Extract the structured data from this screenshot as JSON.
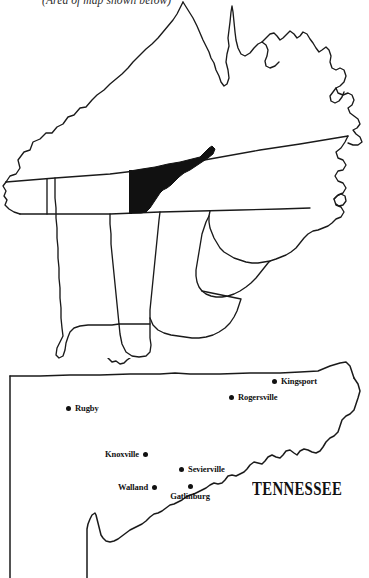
{
  "figure": {
    "caption": "(Area of map shown below)",
    "state_label": "TENNESSEE"
  },
  "locator_map": {
    "name": "southeastern-us-locator-map",
    "highlight_color": "#111111",
    "outline_color": "#1a1a1a",
    "highlighted_region": "East Tennessee",
    "states_shown": [
      "Kentucky",
      "West Virginia",
      "Virginia",
      "Tennessee",
      "North Carolina",
      "South Carolina",
      "Georgia",
      "Alabama",
      "Mississippi"
    ]
  },
  "detail_map": {
    "name": "east-tennessee-detail-map",
    "outline_color": "#1a1a1a",
    "cities": [
      {
        "name": "Kingsport",
        "label_position": "right",
        "x": 274,
        "y": 381
      },
      {
        "name": "Rogersville",
        "label_position": "right",
        "x": 231,
        "y": 397
      },
      {
        "name": "Rugby",
        "label_position": "right",
        "x": 69,
        "y": 408
      },
      {
        "name": "Knoxville",
        "label_position": "left",
        "x": 146,
        "y": 454
      },
      {
        "name": "Sevierville",
        "label_position": "right",
        "x": 182,
        "y": 468
      },
      {
        "name": "Walland",
        "label_position": "left",
        "x": 155,
        "y": 486
      },
      {
        "name": "Gatlinburg",
        "label_position": "below",
        "x": 190,
        "y": 488
      }
    ]
  }
}
